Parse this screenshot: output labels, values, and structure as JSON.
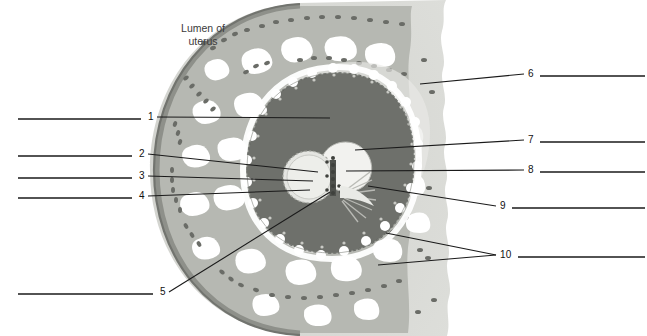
{
  "figure": {
    "title_text": "Lumen of\nuterus",
    "colors": {
      "background": "#ffffff",
      "myometrium": "#d7d8d3",
      "endometrium": "#b6b8b2",
      "endometrium_deep": "#a9aba4",
      "lumen_epithelium": "#9a9c96",
      "chorion_dark": "#6e706b",
      "gland_lumen": "#ffffff",
      "vessel_speck": "#6a6c67",
      "embryo_pale": "#e6e6e2",
      "line": "#1a1a1a",
      "text": "#111111"
    }
  },
  "annotations": {
    "lumen_label": "Lumen of\nuterus",
    "left_labels": [
      {
        "number": "1",
        "num_x": 148,
        "num_y": 118,
        "blank_x1": 18,
        "blank_x2": 141,
        "leader_x2": 330,
        "leader_y2": 118
      },
      {
        "number": "2",
        "num_x": 139,
        "num_y": 155,
        "blank_x1": 18,
        "blank_x2": 132,
        "leader_x2": 318,
        "leader_y2": 172
      },
      {
        "number": "3",
        "num_x": 139,
        "num_y": 177,
        "blank_x1": 18,
        "blank_x2": 132,
        "leader_x2": 313,
        "leader_y2": 181
      },
      {
        "number": "4",
        "num_x": 139,
        "num_y": 197,
        "blank_x1": 18,
        "blank_x2": 132,
        "leader_x2": 310,
        "leader_y2": 190
      },
      {
        "number": "5",
        "num_x": 160,
        "num_y": 293,
        "blank_x1": 18,
        "blank_x2": 153,
        "leader_x2": 330,
        "leader_y2": 192
      }
    ],
    "right_labels": [
      {
        "number": "6",
        "num_x": 528,
        "num_y": 75,
        "blank_x1": 540,
        "blank_x2": 645,
        "leader_x2": 420,
        "leader_y2": 84
      },
      {
        "number": "7",
        "num_x": 528,
        "num_y": 141,
        "blank_x1": 540,
        "blank_x2": 645,
        "leader_x2": 355,
        "leader_y2": 150
      },
      {
        "number": "8",
        "num_x": 528,
        "num_y": 171,
        "blank_x1": 540,
        "blank_x2": 645,
        "leader_x2": 346,
        "leader_y2": 171
      },
      {
        "number": "9",
        "num_x": 500,
        "num_y": 207,
        "blank_x1": 512,
        "blank_x2": 645,
        "leader_x2": 368,
        "leader_y2": 186
      },
      {
        "number": "10",
        "num_x": 500,
        "num_y": 256,
        "blank_x1": 518,
        "blank_x2": 645,
        "leader_x2": 378,
        "leader_y2": 265
      }
    ],
    "extra_leader_10": {
      "leader_x2": 386,
      "leader_y2": 233
    }
  }
}
